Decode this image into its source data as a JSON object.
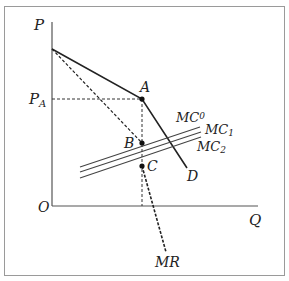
{
  "diagram": {
    "type": "monopoly pricing with marginal cost shift",
    "axes": {
      "y_label": "P",
      "x_label": "Q",
      "origin_label": "O"
    },
    "price_label": "P",
    "price_sub": "A",
    "points": {
      "A": "A",
      "B": "B",
      "C": "C"
    },
    "curves": {
      "demand_label": "D",
      "mr_label": "MR",
      "mc0_base": "MC",
      "mc0_sub": "0",
      "mc1_base": "MC",
      "mc1_sub": "1",
      "mc2_base": "MC",
      "mc2_sub": "2"
    },
    "colors": {
      "line": "#222222",
      "frame": "#9a9a9a",
      "mc_lines": "#444444"
    }
  }
}
